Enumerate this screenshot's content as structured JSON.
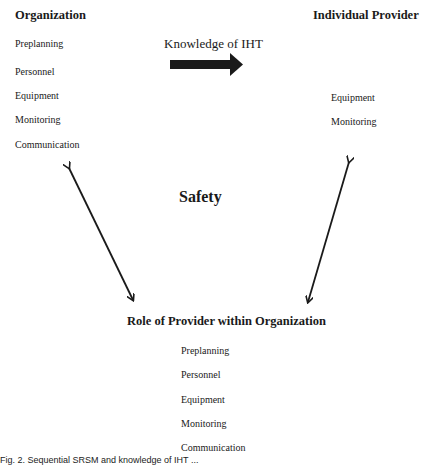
{
  "organization": {
    "title": "Organization",
    "items": [
      "Preplanning",
      "Personnel",
      "Equipment",
      "Monitoring",
      "Communication"
    ]
  },
  "individual_provider": {
    "title": "Individual Provider",
    "items": [
      "Equipment",
      "Monitoring"
    ]
  },
  "knowledge_arrow": {
    "label": "Knowledge of IHT",
    "icon": "right-arrow-icon"
  },
  "center": {
    "label": "Safety"
  },
  "role": {
    "title": "Role of Provider within Organization",
    "items": [
      "Preplanning",
      "Personnel",
      "Equipment",
      "Monitoring",
      "Communication"
    ]
  },
  "connectors": [
    {
      "icon": "double-arrow-icon",
      "from": "Organization",
      "to": "Role of Provider within Organization"
    },
    {
      "icon": "double-arrow-icon",
      "from": "Individual Provider",
      "to": "Role of Provider within Organization"
    }
  ],
  "caption": {
    "text": "Fig. 2. Sequential SRSM and knowledge of IHT ..."
  },
  "colors": {
    "text": "#1a1a1a",
    "arrow": "#1a1a1a",
    "background": "#ffffff"
  }
}
